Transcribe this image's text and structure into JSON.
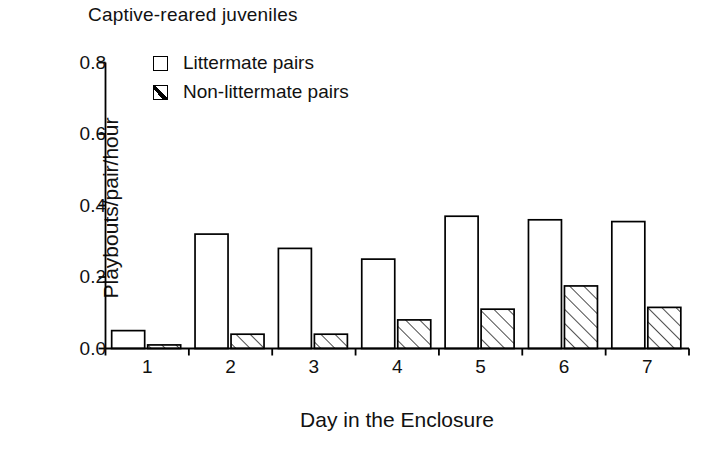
{
  "chart_data": {
    "type": "bar",
    "title": "Captive-reared juveniles",
    "xlabel": "Day in the Enclosure",
    "ylabel": "Playbouts/pair/hour",
    "categories": [
      "1",
      "2",
      "3",
      "4",
      "5",
      "6",
      "7"
    ],
    "series": [
      {
        "name": "Littermate pairs",
        "style": "open",
        "values": [
          0.05,
          0.32,
          0.28,
          0.25,
          0.37,
          0.36,
          0.355
        ]
      },
      {
        "name": "Non-littermate pairs",
        "style": "hatched",
        "values": [
          0.01,
          0.04,
          0.04,
          0.08,
          0.11,
          0.175,
          0.115
        ]
      }
    ],
    "ylim": [
      0.0,
      0.8
    ],
    "yticks": [
      0.0,
      0.2,
      0.4,
      0.6,
      0.8
    ],
    "ytick_labels": [
      "0.0",
      "0.2",
      "0.4",
      "0.6",
      "0.8"
    ],
    "grid": false,
    "legend_position": "top-left-inside",
    "axis_color": "#000000",
    "bar_edge_color": "#000000",
    "bar_fill_color": "#ffffff"
  },
  "legend": {
    "items": [
      {
        "label": "Littermate pairs",
        "swatch": "open-square-icon"
      },
      {
        "label": "Non-littermate pairs",
        "swatch": "hatched-square-icon"
      }
    ]
  }
}
